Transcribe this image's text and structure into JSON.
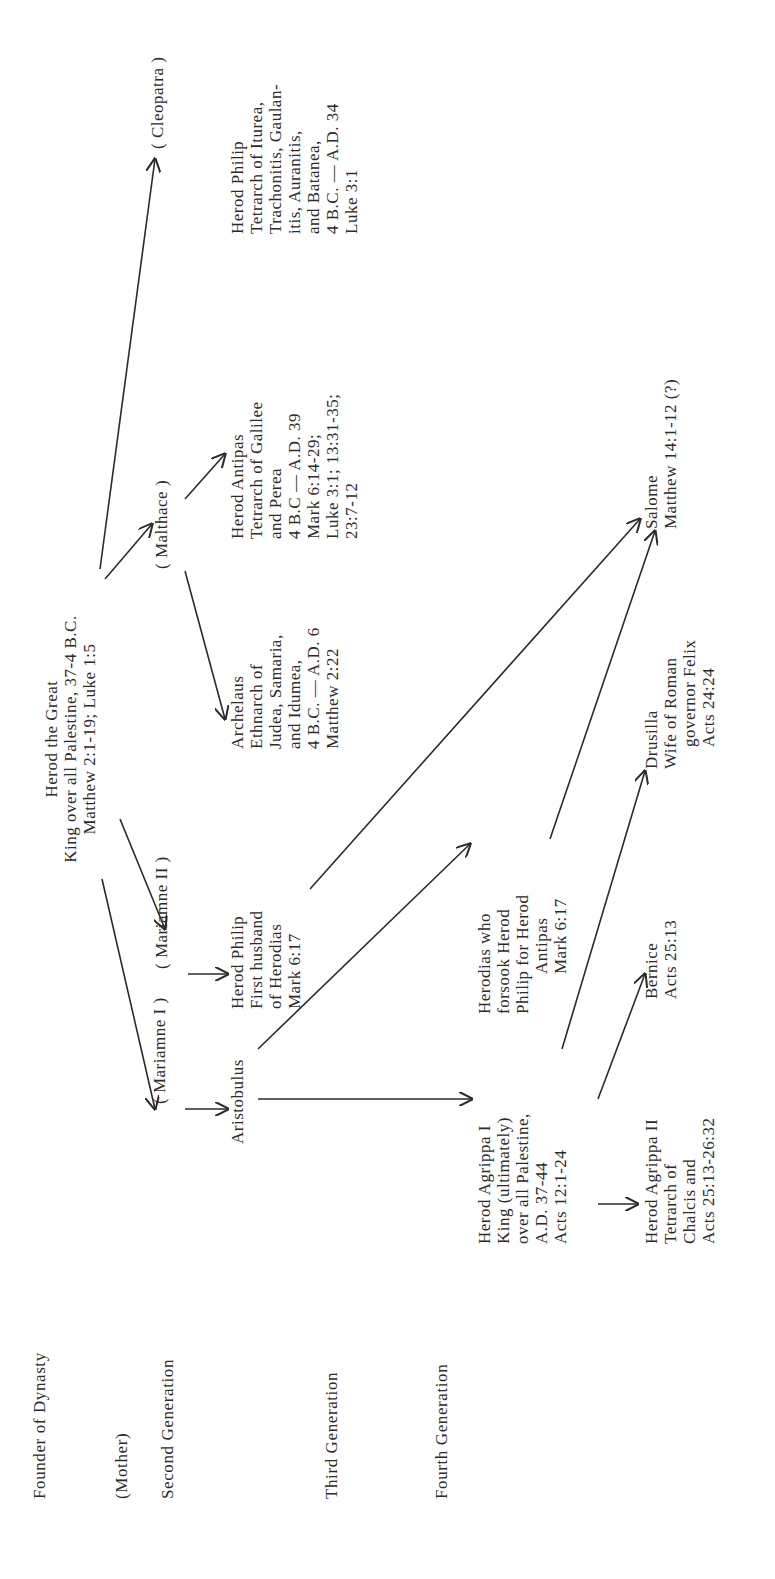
{
  "generations": [
    {
      "id": "founder",
      "label": "Founder of Dynasty"
    },
    {
      "id": "mother",
      "label": "(Mother)"
    },
    {
      "id": "second",
      "label": "Second Generation"
    },
    {
      "id": "third",
      "label": "Third Generation"
    },
    {
      "id": "fourth",
      "label": "Fourth Generation"
    }
  ],
  "founder": {
    "name": "Herod the Great",
    "lines": [
      "Herod  the  Great",
      "King over all Palestine,  37-4  B.C.",
      "Matthew  2:1-19;  Luke  1:5"
    ]
  },
  "mothers": [
    {
      "name": "( Mariamne  I )"
    },
    {
      "name": "( Mariamne  II )"
    },
    {
      "name": "( Malthace )"
    },
    {
      "name": "( Cleopatra )"
    }
  ],
  "second_generation": [
    {
      "name": "Aristobulus",
      "lines": [
        "Aristobulus"
      ]
    },
    {
      "name": "Herod Philip",
      "lines": [
        "Herod  Philip",
        "First  husband",
        "of  Herodias",
        "Mark  6:17"
      ]
    },
    {
      "name": "Archelaus",
      "lines": [
        "Archelaus",
        "Ethnarch  of",
        "Judea,  Samaria,",
        "and  Idumea,",
        "4  B.C. — A.D.  6",
        "Matthew  2:22"
      ]
    },
    {
      "name": "Herod Antipas",
      "lines": [
        "Herod  Antipas",
        "Tetrarch  of  Galilee",
        "and  Perea",
        "4  B.C — A.D.  39",
        "Mark  6:14-29;",
        "Luke  3:1;  13:31-35;",
        "23:7-12"
      ]
    },
    {
      "name": "Herod Philip (Tetrarch)",
      "lines": [
        "Herod  Philip",
        "Tetrarch  of  Iturea,",
        "Trachonitis,  Gaulan-",
        "itis,  Auranitis,",
        "and  Batanea,",
        "4  B.C. — A.D.  34",
        "Luke  3:1"
      ]
    }
  ],
  "third_generation": [
    {
      "name": "Herod Agrippa I",
      "lines": [
        "Herod  Agrippa  I",
        "King  (ultimately)",
        "over  all  Palestine,",
        "A.D.  37-44",
        "Acts  12:1-24"
      ]
    },
    {
      "name": "Herodias",
      "lines": [
        "Herodias   who",
        "forsook  Herod",
        "Philip  for  Herod",
        "Antipas",
        "Mark  6:17"
      ]
    }
  ],
  "fourth_generation": [
    {
      "name": "Herod Agrippa II",
      "lines": [
        "Herod  Agrippa  II",
        "Tetrarch  of",
        "Chalcis and",
        "Acts  25:13-26:32"
      ]
    },
    {
      "name": "Bernice",
      "lines": [
        "Bernice",
        "Acts  25:13"
      ]
    },
    {
      "name": "Drusilla",
      "lines": [
        "Drusilla",
        "Wife  of  Roman",
        "governor  Felix",
        "Acts  24:24"
      ]
    },
    {
      "name": "Salome",
      "lines": [
        "Salome",
        "Matthew  14:1-12  (?)"
      ]
    }
  ]
}
